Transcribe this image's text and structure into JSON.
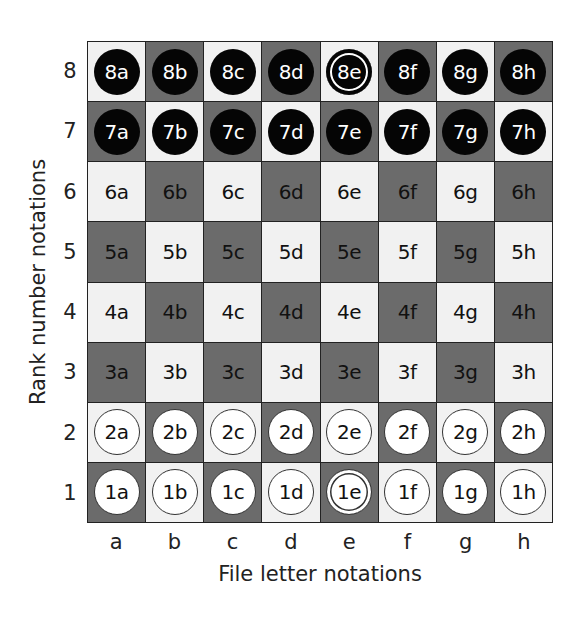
{
  "axis": {
    "x_title": "File letter notations",
    "y_title": "Rank number notations",
    "files": [
      "a",
      "b",
      "c",
      "d",
      "e",
      "f",
      "g",
      "h"
    ],
    "ranks": [
      "8",
      "7",
      "6",
      "5",
      "4",
      "3",
      "2",
      "1"
    ]
  },
  "colors": {
    "light_square": "#f1f1f1",
    "dark_square": "#6b6b6b",
    "black_piece": "#050505",
    "white_piece": "#ffffff"
  },
  "board": {
    "rows": [
      [
        {
          "label": "8a",
          "piece": "black"
        },
        {
          "label": "8b",
          "piece": "black"
        },
        {
          "label": "8c",
          "piece": "black"
        },
        {
          "label": "8d",
          "piece": "black"
        },
        {
          "label": "8e",
          "piece": "black",
          "king": true
        },
        {
          "label": "8f",
          "piece": "black"
        },
        {
          "label": "8g",
          "piece": "black"
        },
        {
          "label": "8h",
          "piece": "black"
        }
      ],
      [
        {
          "label": "7a",
          "piece": "black"
        },
        {
          "label": "7b",
          "piece": "black"
        },
        {
          "label": "7c",
          "piece": "black"
        },
        {
          "label": "7d",
          "piece": "black"
        },
        {
          "label": "7e",
          "piece": "black"
        },
        {
          "label": "7f",
          "piece": "black"
        },
        {
          "label": "7g",
          "piece": "black"
        },
        {
          "label": "7h",
          "piece": "black"
        }
      ],
      [
        {
          "label": "6a"
        },
        {
          "label": "6b"
        },
        {
          "label": "6c"
        },
        {
          "label": "6d"
        },
        {
          "label": "6e"
        },
        {
          "label": "6f"
        },
        {
          "label": "6g"
        },
        {
          "label": "6h"
        }
      ],
      [
        {
          "label": "5a"
        },
        {
          "label": "5b"
        },
        {
          "label": "5c"
        },
        {
          "label": "5d"
        },
        {
          "label": "5e"
        },
        {
          "label": "5f"
        },
        {
          "label": "5g"
        },
        {
          "label": "5h"
        }
      ],
      [
        {
          "label": "4a"
        },
        {
          "label": "4b"
        },
        {
          "label": "4c"
        },
        {
          "label": "4d"
        },
        {
          "label": "4e"
        },
        {
          "label": "4f"
        },
        {
          "label": "4g"
        },
        {
          "label": "4h"
        }
      ],
      [
        {
          "label": "3a"
        },
        {
          "label": "3b"
        },
        {
          "label": "3c"
        },
        {
          "label": "3d"
        },
        {
          "label": "3e"
        },
        {
          "label": "3f"
        },
        {
          "label": "3g"
        },
        {
          "label": "3h"
        }
      ],
      [
        {
          "label": "2a",
          "piece": "white"
        },
        {
          "label": "2b",
          "piece": "white"
        },
        {
          "label": "2c",
          "piece": "white"
        },
        {
          "label": "2d",
          "piece": "white"
        },
        {
          "label": "2e",
          "piece": "white"
        },
        {
          "label": "2f",
          "piece": "white"
        },
        {
          "label": "2g",
          "piece": "white"
        },
        {
          "label": "2h",
          "piece": "white"
        }
      ],
      [
        {
          "label": "1a",
          "piece": "white"
        },
        {
          "label": "1b",
          "piece": "white"
        },
        {
          "label": "1c",
          "piece": "white"
        },
        {
          "label": "1d",
          "piece": "white"
        },
        {
          "label": "1e",
          "piece": "white",
          "king": true
        },
        {
          "label": "1f",
          "piece": "white"
        },
        {
          "label": "1g",
          "piece": "white"
        },
        {
          "label": "1h",
          "piece": "white"
        }
      ]
    ]
  }
}
